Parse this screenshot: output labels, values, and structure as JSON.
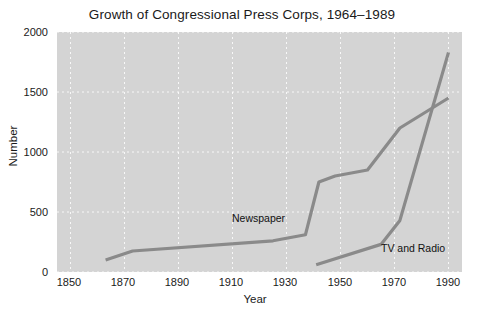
{
  "chart_data": {
    "type": "line",
    "title": "Growth of Congressional Press Corps, 1964–1989",
    "xlabel": "Year",
    "ylabel": "Number",
    "xlim": [
      1845,
      1995
    ],
    "ylim": [
      0,
      2000
    ],
    "xticks": [
      1850,
      1870,
      1890,
      1910,
      1930,
      1950,
      1970,
      1990
    ],
    "xtick_labels": [
      "1850",
      "1870",
      "1890",
      "1910",
      "1930",
      "1950",
      "1970",
      "1990"
    ],
    "yticks": [
      0,
      500,
      1000,
      1500,
      2000
    ],
    "ytick_labels": [
      "0",
      "500",
      "1000",
      "1500",
      "2000"
    ],
    "grid": true,
    "grid_style": "dotted-white",
    "legend_position": "inline-annotations",
    "panel_background": "#d4d4d4",
    "line_color": "#8a8a8a",
    "series": [
      {
        "name": "Newspaper",
        "annotation": "Newspaper",
        "annotation_x": 1913,
        "annotation_y": 375,
        "x": [
          1863,
          1873,
          1925,
          1937,
          1942,
          1948,
          1960,
          1972,
          1990
        ],
        "values": [
          100,
          175,
          260,
          310,
          750,
          800,
          850,
          1200,
          1450
        ]
      },
      {
        "name": "TV and Radio",
        "annotation": "TV and Radio",
        "annotation_x": 1968,
        "annotation_y": 130,
        "x": [
          1941,
          1965,
          1972,
          1990
        ],
        "values": [
          60,
          230,
          430,
          1830
        ]
      }
    ]
  }
}
